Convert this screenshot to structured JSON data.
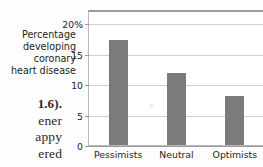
{
  "page_text": {
    "lines": [
      {
        "text": "1.6).",
        "bold": true
      },
      {
        "text": "ener",
        "bold": false
      },
      {
        "text": "appy",
        "bold": false
      },
      {
        "text": "ered",
        "bold": false
      }
    ]
  },
  "chart_data": {
    "type": "bar",
    "title": "",
    "xlabel": "",
    "ylabel_lines": [
      "Percentage",
      "developing",
      "coronary",
      "heart disease"
    ],
    "categories": [
      "Pessimists",
      "Neutral",
      "Optimists"
    ],
    "values": [
      17.2,
      11.8,
      8.0
    ],
    "ylim": [
      0,
      22
    ],
    "yticks": [
      0,
      5,
      10,
      15,
      20
    ],
    "ytick_labels": [
      "0",
      "5",
      "10",
      "15",
      "20%"
    ],
    "grid": true,
    "legend": "none",
    "bar_color": "#7b7b7b",
    "gridline_color": "#cfcfcf",
    "axis_color": "#9a9a9a",
    "text_color": "#1d1d1b"
  }
}
